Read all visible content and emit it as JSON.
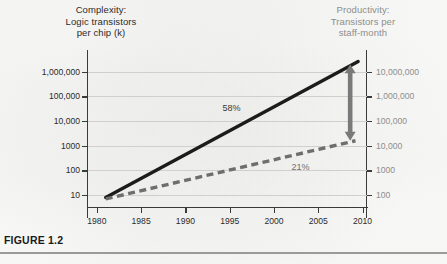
{
  "figure": {
    "caption": "FIGURE 1.2",
    "left_axis_title": "Complexity:\nLogic transistors\nper chip (k)",
    "right_axis_title": "Productivity:\nTransistors per\nstaff-month"
  },
  "colors": {
    "complexity_line": "#1c1c1c",
    "productivity_line": "#6e6e6e",
    "gap_arrow": "#7a7a7a",
    "gridline": "#cfcfcf",
    "axis": "#3a3a3a",
    "right_label": "#8d8d8d",
    "left_label": "#2b2b2b",
    "background": "#fdfdfc"
  },
  "chart_data": {
    "type": "line",
    "title": "",
    "xlabel": "",
    "ylabel": "Logic transistors per chip (k)",
    "ylabel_right": "Transistors per staff-month",
    "xlim": [
      1979,
      2010.5
    ],
    "xticks": [
      "1980",
      "1985",
      "1990",
      "1995",
      "2000",
      "2005",
      "2010"
    ],
    "xtick_values": [
      1980,
      1985,
      1990,
      1995,
      2000,
      2005,
      2010
    ],
    "yscale": "log",
    "ylim": [
      3,
      3000000
    ],
    "yticks_left": [
      "10",
      "100",
      "1000",
      "10,000",
      "100,000",
      "1,000,000"
    ],
    "ytick_values_left": [
      10,
      100,
      1000,
      10000,
      100000,
      1000000
    ],
    "yticks_right": [
      "100",
      "1000",
      "10,000",
      "100,000",
      "1,000,000",
      "10,000,000"
    ],
    "ytick_values_right": [
      100,
      1000,
      10000,
      100000,
      1000000,
      10000000
    ],
    "grid": true,
    "legend_position": "none",
    "series": [
      {
        "name": "Complexity (logic transistors per chip, k)",
        "style": "solid",
        "color": "#1c1c1c",
        "growth_label": "58%",
        "x": [
          1981,
          2009.5
        ],
        "values": [
          8,
          2600000
        ]
      },
      {
        "name": "Productivity (transistors per staff-month)",
        "style": "dashed",
        "color": "#6e6e6e",
        "growth_label": "21%",
        "x": [
          1981,
          2009.2
        ],
        "values": [
          7,
          1600
        ]
      }
    ],
    "annotations": [
      {
        "text": "58%",
        "x": 1995.2,
        "y": 33000,
        "color": "#3a3a3a"
      },
      {
        "text": "21%",
        "x": 2003.0,
        "y": 140,
        "color": "#6f6f6f"
      },
      {
        "text": "design-gap-arrow",
        "x": 2008.6,
        "y_top": 2000000,
        "y_bottom": 1600
      }
    ]
  }
}
